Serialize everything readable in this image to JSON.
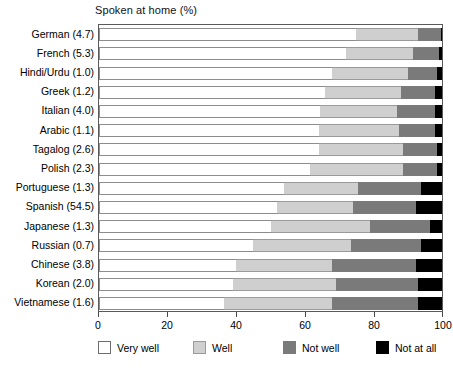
{
  "chart_data": {
    "type": "bar",
    "subtype": "horizontal-stacked-100",
    "title": "Spoken at home (%)",
    "xlabel": "",
    "ylabel": "",
    "xlim": [
      0,
      100
    ],
    "xticks": [
      0,
      20,
      40,
      60,
      80,
      100
    ],
    "grid": false,
    "legend_position": "bottom",
    "categories": [
      "German (4.7)",
      "French (5.3)",
      "Hindi/Urdu (1.0)",
      "Greek (1.2)",
      "Italian (4.0)",
      "Arabic (1.1)",
      "Tagalog (2.6)",
      "Polish (2.3)",
      "Portuguese (1.3)",
      "Spanish (54.5)",
      "Japanese (1.3)",
      "Russian (0.7)",
      "Chinese (3.8)",
      "Korean (2.0)",
      "Vietnamese (1.6)"
    ],
    "series": [
      {
        "name": "Very well",
        "color": "#ffffff",
        "values": [
          75.0,
          72.0,
          68.0,
          66.0,
          64.5,
          64.0,
          64.0,
          61.5,
          54.0,
          52.0,
          50.0,
          45.0,
          40.0,
          39.0,
          36.5
        ]
      },
      {
        "name": "Well",
        "color": "#cfcfcf",
        "values": [
          18.0,
          19.5,
          22.0,
          22.0,
          22.5,
          23.5,
          24.5,
          27.0,
          21.5,
          22.0,
          29.0,
          28.5,
          28.0,
          30.0,
          31.5
        ]
      },
      {
        "name": "Not well",
        "color": "#7a7a7a",
        "values": [
          6.6,
          7.5,
          8.6,
          10.0,
          11.0,
          10.5,
          10.0,
          10.0,
          18.5,
          18.5,
          17.5,
          20.5,
          24.5,
          24.0,
          25.0
        ]
      },
      {
        "name": "Not at all",
        "color": "#000000",
        "values": [
          0.4,
          1.0,
          1.4,
          2.0,
          2.0,
          2.0,
          1.5,
          1.5,
          6.0,
          7.5,
          3.5,
          6.0,
          7.5,
          7.0,
          7.0
        ]
      }
    ],
    "legend": [
      {
        "label": "Very well",
        "swatch": "very-well"
      },
      {
        "label": "Well",
        "swatch": "well"
      },
      {
        "label": "Not well",
        "swatch": "not-well"
      },
      {
        "label": "Not at all",
        "swatch": "not-at-all"
      }
    ]
  }
}
